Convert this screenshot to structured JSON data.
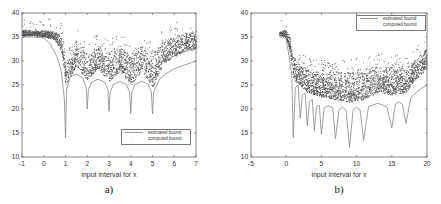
{
  "chart_data": [
    {
      "type": "line",
      "panel_label": "a)",
      "title": "",
      "xlabel": "input interval for x",
      "ylabel": "",
      "xlim": [
        -1,
        7
      ],
      "ylim": [
        10,
        40
      ],
      "xticks": [
        -1,
        0,
        1,
        2,
        3,
        4,
        5,
        6,
        7
      ],
      "yticks": [
        10,
        15,
        20,
        25,
        30,
        35,
        40
      ],
      "grid": false,
      "legend_position": "lower right",
      "legend": [
        "estimated bound",
        "computed bound"
      ],
      "series": [
        {
          "name": "estimated bound",
          "style": "line",
          "x": [
            -1,
            -0.5,
            0,
            0.3,
            0.6,
            0.8,
            0.95,
            1.0,
            1.05,
            1.2,
            1.5,
            1.8,
            1.95,
            2.0,
            2.05,
            2.2,
            2.5,
            2.8,
            2.95,
            3.0,
            3.05,
            3.2,
            3.5,
            3.8,
            3.95,
            4.0,
            4.05,
            4.2,
            4.5,
            4.8,
            4.95,
            5.0,
            5.05,
            5.3,
            5.6,
            6.0,
            6.5,
            7.0
          ],
          "y": [
            35.0,
            35.0,
            34.8,
            33.5,
            31.0,
            28.0,
            22.0,
            14.0,
            24.0,
            26.6,
            27.3,
            26.4,
            24.5,
            20.0,
            24.0,
            25.6,
            26.2,
            25.6,
            24.0,
            19.5,
            23.5,
            25.1,
            25.7,
            25.1,
            23.5,
            19.0,
            23.5,
            25.1,
            25.8,
            25.2,
            23.5,
            19.0,
            23.5,
            26.0,
            27.3,
            28.4,
            29.2,
            30.0
          ]
        },
        {
          "name": "computed bound",
          "style": "scatter",
          "description": "dense point cloud lying above the estimated bound",
          "x": [
            -1,
            -0.5,
            0,
            0.5,
            0.8,
            1.0,
            1.5,
            2.0,
            2.5,
            3.0,
            3.5,
            4.0,
            4.5,
            5.0,
            5.5,
            6.0,
            6.5,
            7.0
          ],
          "y_band_low": [
            35.0,
            35.0,
            35.0,
            34.5,
            32.0,
            25.0,
            29.0,
            26.0,
            28.5,
            25.5,
            28.0,
            25.0,
            28.0,
            24.5,
            29.5,
            31.0,
            32.0,
            32.5
          ],
          "y_band_high": [
            36.5,
            36.5,
            36.5,
            36.3,
            35.5,
            30.0,
            34.5,
            31.5,
            33.5,
            32.0,
            33.5,
            31.5,
            33.5,
            32.0,
            34.5,
            35.5,
            36.0,
            36.5
          ]
        }
      ]
    },
    {
      "type": "line",
      "panel_label": "b)",
      "title": "",
      "xlabel": "input interval for x",
      "ylabel": "",
      "xlim": [
        -5,
        20
      ],
      "ylim": [
        10,
        40
      ],
      "xticks": [
        -5,
        0,
        5,
        10,
        15,
        20
      ],
      "yticks": [
        10,
        15,
        20,
        25,
        30,
        35,
        40
      ],
      "grid": false,
      "legend_position": "upper right",
      "legend": [
        "estimated bound",
        "computed bound"
      ],
      "series": [
        {
          "name": "estimated bound",
          "style": "line",
          "x": [
            -1,
            -0.5,
            0,
            0.4,
            0.8,
            1.0,
            1.3,
            1.7,
            2.0,
            2.3,
            2.7,
            3.0,
            3.3,
            3.7,
            4.0,
            4.3,
            4.7,
            5.0,
            5.4,
            6.0,
            6.6,
            7.0,
            7.5,
            8.0,
            8.5,
            9.0,
            9.5,
            10.0,
            10.5,
            11.0,
            11.7,
            13.0,
            14.3,
            15.0,
            15.5,
            16.0,
            16.5,
            17.0,
            17.7,
            18.5,
            19.3,
            20.0
          ],
          "y": [
            35.0,
            35.0,
            34.5,
            31.0,
            27.0,
            14.0,
            24.5,
            25.0,
            18.0,
            22.8,
            23.3,
            16.5,
            21.5,
            22.0,
            15.5,
            20.5,
            20.8,
            14.7,
            20.2,
            20.7,
            20.2,
            13.8,
            19.8,
            20.4,
            19.8,
            12.0,
            19.8,
            20.4,
            19.8,
            13.5,
            20.5,
            21.2,
            20.5,
            16.0,
            21.0,
            21.5,
            21.0,
            17.0,
            22.3,
            23.5,
            24.4,
            25.0
          ]
        },
        {
          "name": "computed bound",
          "style": "scatter",
          "description": "dense point cloud lying above the estimated bound",
          "x": [
            -1,
            0,
            0.5,
            1,
            2,
            3,
            4,
            5,
            7,
            9,
            11,
            13,
            15,
            17,
            18,
            19,
            20
          ],
          "y_band_low": [
            34.5,
            34.5,
            32.0,
            26.0,
            25.0,
            23.5,
            23.0,
            22.5,
            22.0,
            21.5,
            22.0,
            23.5,
            23.0,
            23.5,
            25.5,
            27.0,
            28.5
          ],
          "y_band_high": [
            36.5,
            36.5,
            35.0,
            30.5,
            29.5,
            28.5,
            28.0,
            28.0,
            28.0,
            28.0,
            28.5,
            29.0,
            29.0,
            28.5,
            30.0,
            31.5,
            33.0
          ]
        }
      ]
    }
  ],
  "figure": {
    "panels": [
      {
        "caption": "a)",
        "xlabel": "input interval for x",
        "legend": [
          "estimated bound",
          "computed bound"
        ]
      },
      {
        "caption": "b)",
        "xlabel": "input interval for x",
        "legend": [
          "estimated bound",
          "computed bound"
        ]
      }
    ]
  }
}
